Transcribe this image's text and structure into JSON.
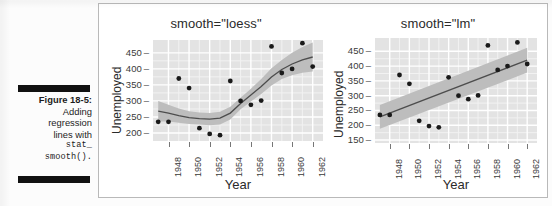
{
  "figure": {
    "number_label": "Figure 18-5:",
    "caption_line_1": "Adding",
    "caption_line_2": "regression",
    "caption_line_3": "lines with",
    "caption_code_1": "stat_",
    "caption_code_2": "smooth()."
  },
  "colors": {
    "panel_background": "#e3e3e3",
    "gridline_major": "#ffffff",
    "gridline_minor": "#f2f2f2",
    "point_fill": "#1a1a1a",
    "smooth_line": "#4d4d4d",
    "confidence_band": "#bdbdbd",
    "frame_border": "#b9b9b9",
    "caption_rule": "#111111"
  },
  "chart_data": [
    {
      "id": "loess",
      "type": "scatter",
      "title": "smooth=\"loess\"",
      "xlabel": "Year",
      "ylabel": "Unemployed",
      "xlim": [
        1946.5,
        1963.0
      ],
      "ylim": [
        175,
        490
      ],
      "xticks": [
        1948,
        1950,
        1952,
        1954,
        1956,
        1958,
        1960,
        1962
      ],
      "yticks": [
        200,
        250,
        300,
        350,
        400,
        450
      ],
      "grid": true,
      "legend": "none",
      "smoother": "loess",
      "confidence_band": true,
      "x": [
        1947,
        1948,
        1949,
        1950,
        1951,
        1952,
        1953,
        1954,
        1955,
        1956,
        1957,
        1958,
        1959,
        1960,
        1961,
        1962
      ],
      "y": [
        235,
        235,
        370,
        340,
        215,
        197,
        193,
        362,
        300,
        288,
        301,
        470,
        387,
        400,
        480,
        407
      ],
      "smooth_line": {
        "x": [
          1947,
          1948,
          1949,
          1950,
          1951,
          1952,
          1953,
          1954,
          1955,
          1956,
          1957,
          1958,
          1959,
          1960,
          1961,
          1962
        ],
        "y": [
          268,
          262,
          254,
          248,
          245,
          243,
          246,
          262,
          292,
          318,
          345,
          375,
          398,
          415,
          428,
          437
        ],
        "upper": [
          300,
          288,
          276,
          268,
          264,
          262,
          266,
          282,
          310,
          338,
          368,
          402,
          428,
          450,
          468,
          482
        ],
        "lower": [
          236,
          236,
          232,
          228,
          226,
          224,
          226,
          242,
          274,
          298,
          322,
          348,
          368,
          380,
          388,
          392
        ]
      }
    },
    {
      "id": "lm",
      "type": "scatter",
      "title": "smooth=\"lm\"",
      "xlabel": "Year",
      "ylabel": "Unemployed",
      "xlim": [
        1946.5,
        1963.0
      ],
      "ylim": [
        140,
        495
      ],
      "xticks": [
        1948,
        1950,
        1952,
        1954,
        1956,
        1958,
        1960,
        1962
      ],
      "yticks": [
        150,
        200,
        250,
        300,
        350,
        400,
        450
      ],
      "grid": true,
      "legend": "none",
      "smoother": "lm",
      "confidence_band": true,
      "x": [
        1947,
        1948,
        1949,
        1950,
        1951,
        1952,
        1953,
        1954,
        1955,
        1956,
        1957,
        1958,
        1959,
        1960,
        1961,
        1962
      ],
      "y": [
        235,
        235,
        370,
        340,
        215,
        197,
        193,
        362,
        300,
        288,
        301,
        470,
        387,
        400,
        480,
        407
      ],
      "smooth_line": {
        "x": [
          1947,
          1962
        ],
        "y": [
          228,
          420
        ],
        "upper_start": 268,
        "lower_start": 188,
        "upper_end": 462,
        "lower_end": 378
      }
    }
  ]
}
